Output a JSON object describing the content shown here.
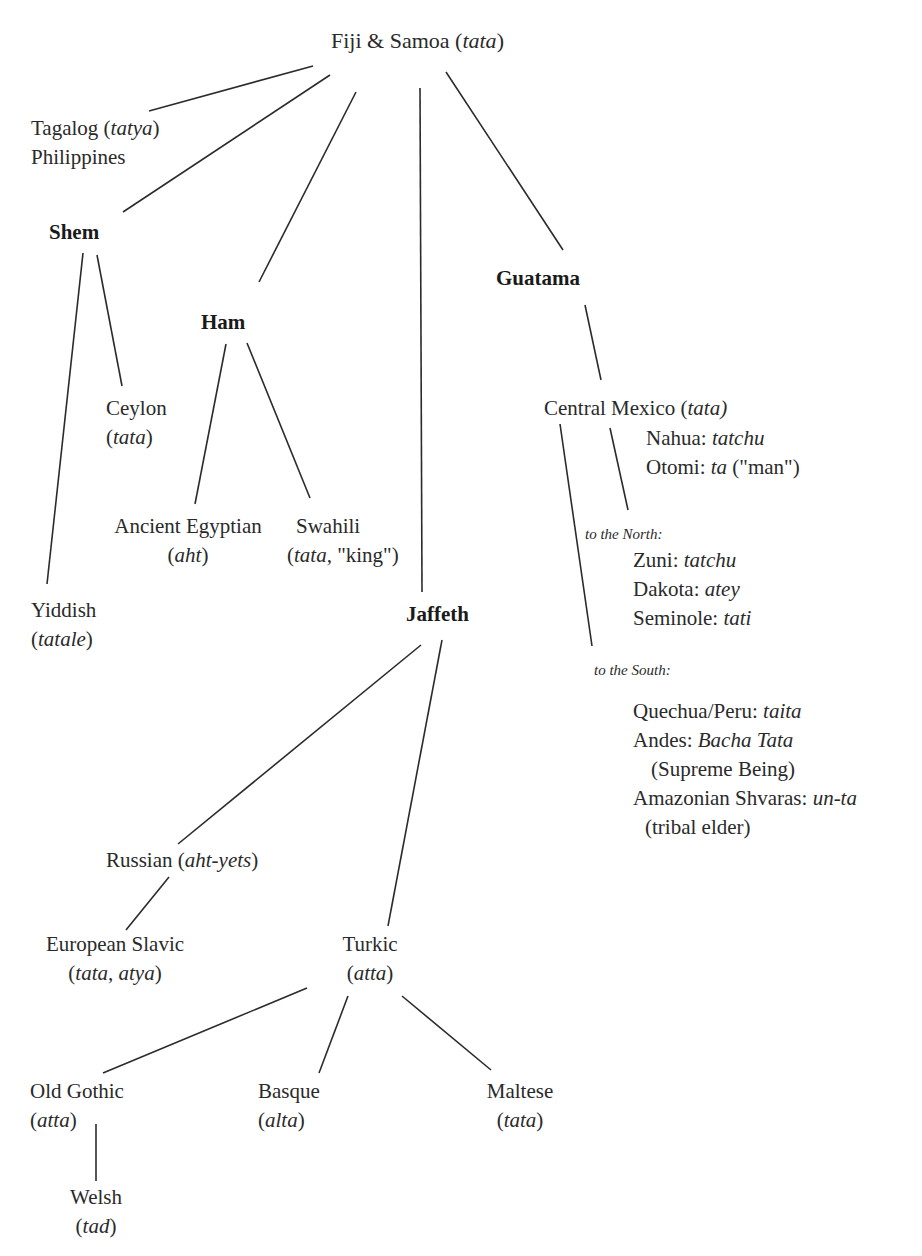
{
  "diagram": {
    "type": "tree",
    "root": {
      "label": "Fiji & Samoa",
      "word": "tata"
    },
    "nodes": {
      "tagalog": {
        "label": "Tagalog",
        "word": "tatya",
        "line2": "Philippines"
      },
      "shem": {
        "label": "Shem"
      },
      "ham": {
        "label": "Ham"
      },
      "guatama": {
        "label": "Guatama"
      },
      "jaffeth": {
        "label": "Jaffeth"
      },
      "ceylon": {
        "label": "Ceylon",
        "word": "tata"
      },
      "yiddish": {
        "label": "Yiddish",
        "word": "tatale"
      },
      "egyptian": {
        "label": "Ancient Egyptian",
        "word": "aht"
      },
      "swahili": {
        "label": "Swahili",
        "word": "tata,",
        "gloss": "\"king\")"
      },
      "central_mexico": {
        "label": "Central Mexico",
        "word": "tata)"
      },
      "nahua": {
        "label": "Nahua:",
        "word": "tatchu"
      },
      "otomi": {
        "label": "Otomi:",
        "word": "ta",
        "gloss": "(\"man\")"
      },
      "north_note": "to the North:",
      "zuni": {
        "label": "Zuni:",
        "word": "tatchu"
      },
      "dakota": {
        "label": "Dakota:",
        "word": "atey"
      },
      "seminole": {
        "label": "Seminole:",
        "word": "tati"
      },
      "south_note": "to the South:",
      "quechua": {
        "label": "Quechua/Peru:",
        "word": "taita"
      },
      "andes": {
        "label": "Andes:",
        "word": "Bacha Tata",
        "gloss": "(Supreme Being)"
      },
      "amazonian": {
        "label": "Amazonian Shvaras:",
        "word": "un-ta",
        "gloss": "(tribal elder)"
      },
      "russian": {
        "label": "Russian",
        "word": "aht-yets"
      },
      "slavic": {
        "label": "European Slavic",
        "word": "tata, atya"
      },
      "turkic": {
        "label": "Turkic",
        "word": "atta"
      },
      "gothic": {
        "label": "Old Gothic",
        "word": "atta"
      },
      "basque": {
        "label": "Basque",
        "word": "alta"
      },
      "maltese": {
        "label": "Maltese",
        "word": "tata"
      },
      "welsh": {
        "label": "Welsh",
        "word": "tad"
      }
    },
    "edges": [
      [
        "root",
        "tagalog"
      ],
      [
        "root",
        "shem"
      ],
      [
        "root",
        "ham"
      ],
      [
        "root",
        "jaffeth"
      ],
      [
        "root",
        "guatama"
      ],
      [
        "shem",
        "yiddish"
      ],
      [
        "shem",
        "ceylon"
      ],
      [
        "ham",
        "egyptian"
      ],
      [
        "ham",
        "swahili"
      ],
      [
        "guatama",
        "central_mexico"
      ],
      [
        "central_mexico",
        "north_note"
      ],
      [
        "central_mexico",
        "south_note"
      ],
      [
        "jaffeth",
        "russian"
      ],
      [
        "jaffeth",
        "turkic"
      ],
      [
        "russian",
        "slavic"
      ],
      [
        "turkic",
        "gothic"
      ],
      [
        "turkic",
        "basque"
      ],
      [
        "turkic",
        "maltese"
      ],
      [
        "gothic",
        "welsh"
      ]
    ]
  },
  "punct": {
    "open": "(",
    "close": ")",
    "space": " "
  }
}
